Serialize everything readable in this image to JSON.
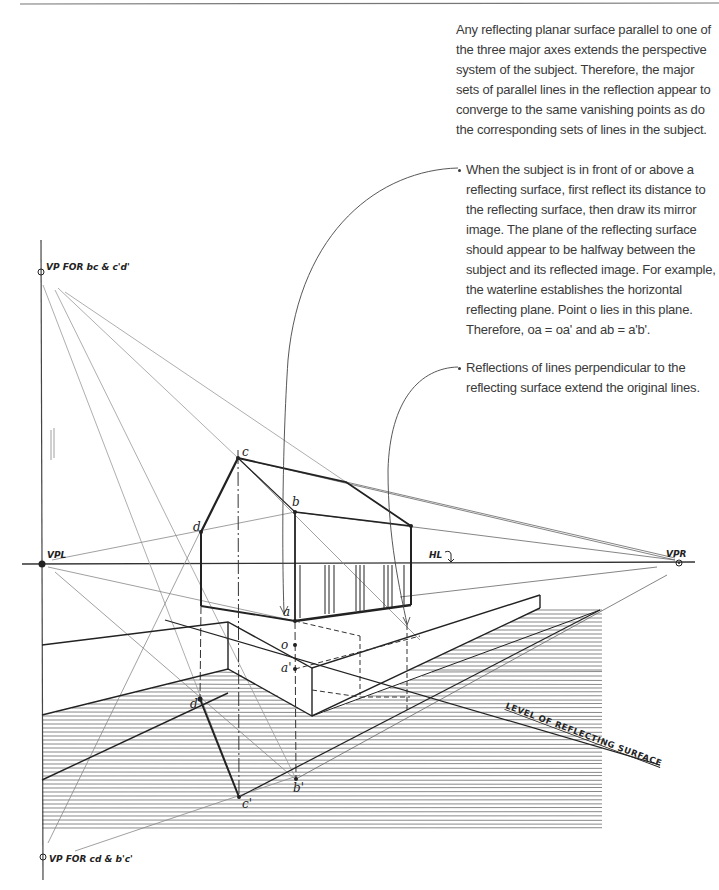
{
  "diagram": {
    "notes": [
      {
        "id": "para-1",
        "text": "Any reflecting planar surface parallel to one of the three major axes extends the perspective system of the subject. Therefore, the major sets of parallel lines in the reflection appear to converge to the same vanishing points as do the corresponding sets of lines in the subject."
      },
      {
        "id": "bullet-2",
        "text": "When the subject is in front of or above a reflecting surface, first reflect its distance to the reflecting surface, then draw its mirror image. The plane of the reflecting surface should appear to be halfway between the subject and its reflected image. For example, the waterline establishes the horizontal reflecting plane. Point o lies in this plane. Therefore, oa = oa' and ab = a'b'."
      },
      {
        "id": "bullet-3",
        "text": "Reflections of lines perpendicular to the reflecting surface extend the original lines."
      }
    ],
    "labels": {
      "vp_top": "VP FOR bc & c'd'",
      "vp_bottom": "VP FOR cd & b'c'",
      "vpl": "VPL",
      "vpr": "VPR",
      "hl": "HL",
      "reflecting_level": "LEVEL OF REFLECTING SURFACE"
    },
    "points": {
      "a": "a",
      "b": "b",
      "c": "c",
      "d": "d",
      "o": "o",
      "a_prime": "a'",
      "b_prime": "b'",
      "c_prime": "c'",
      "d_prime": "d'"
    },
    "colors": {
      "ink": "#222222",
      "construction": "#8a8a8a",
      "text": "#3a3a3a",
      "hatch": "#555555"
    }
  }
}
